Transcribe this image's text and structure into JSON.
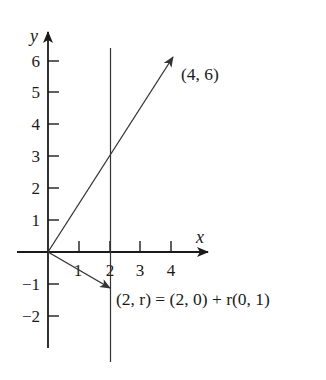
{
  "diagram": {
    "type": "vector-line-plot",
    "axes": {
      "x_label": "x",
      "y_label": "y",
      "x_ticks": [
        "1",
        "2",
        "3",
        "4"
      ],
      "y_ticks_positive": [
        "1",
        "2",
        "3",
        "4",
        "5",
        "6"
      ],
      "y_ticks_negative": [
        "−1",
        "−2"
      ]
    },
    "elements": [
      {
        "kind": "vector",
        "from": [
          0,
          0
        ],
        "to": [
          4,
          6
        ],
        "label": "(4, 6)"
      },
      {
        "kind": "vector",
        "from": [
          0,
          0
        ],
        "to": [
          2,
          -1
        ]
      },
      {
        "kind": "vertical-line",
        "x": 2
      }
    ],
    "annotations": {
      "point_4_6": "(4, 6)",
      "line_equation": "(2, r) = (2, 0) + r(0, 1)"
    },
    "colors": {
      "axis": "#1a1a1a",
      "lines": "#333333",
      "background": "#ffffff"
    }
  }
}
